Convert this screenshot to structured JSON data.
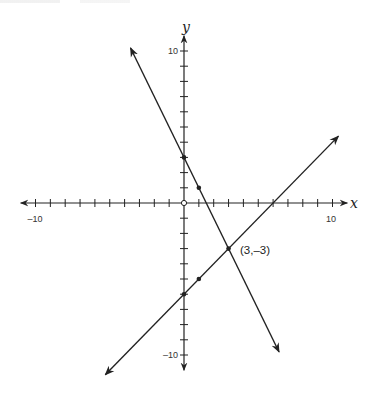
{
  "chart_data": {
    "type": "line",
    "title": "",
    "xlabel": "x",
    "ylabel": "y",
    "xlim": [
      -10,
      10
    ],
    "ylim": [
      -10,
      10
    ],
    "x_ticks_labeled": [
      -10,
      10
    ],
    "y_ticks_labeled": [
      10,
      -10
    ],
    "tick_step": 1,
    "grid": false,
    "legend": null,
    "series": [
      {
        "name": "line-1",
        "equation": "y = -2x + 3",
        "x": [
          -3.6,
          6.4
        ],
        "y": [
          10.2,
          -9.8
        ],
        "marked_points": [
          [
            0,
            3
          ],
          [
            1,
            1
          ],
          [
            3,
            -3
          ]
        ]
      },
      {
        "name": "line-2",
        "equation": "y = x - 6",
        "x": [
          -5.3,
          10.4
        ],
        "y": [
          -11.3,
          4.4
        ],
        "marked_points": [
          [
            0,
            -6
          ],
          [
            1,
            -5
          ],
          [
            3,
            -3
          ]
        ]
      }
    ],
    "annotations": [
      {
        "text": "(3,–3)",
        "x": 3,
        "y": -3
      }
    ],
    "origin_marker": "open-circle"
  },
  "labels": {
    "x_axis": "x",
    "y_axis": "y",
    "x_min": "–10",
    "x_max": "10",
    "y_max": "10",
    "y_min": "–10",
    "intersection": "(3,–3)"
  },
  "colors": {
    "line": "#222222",
    "background": "#ffffff"
  }
}
